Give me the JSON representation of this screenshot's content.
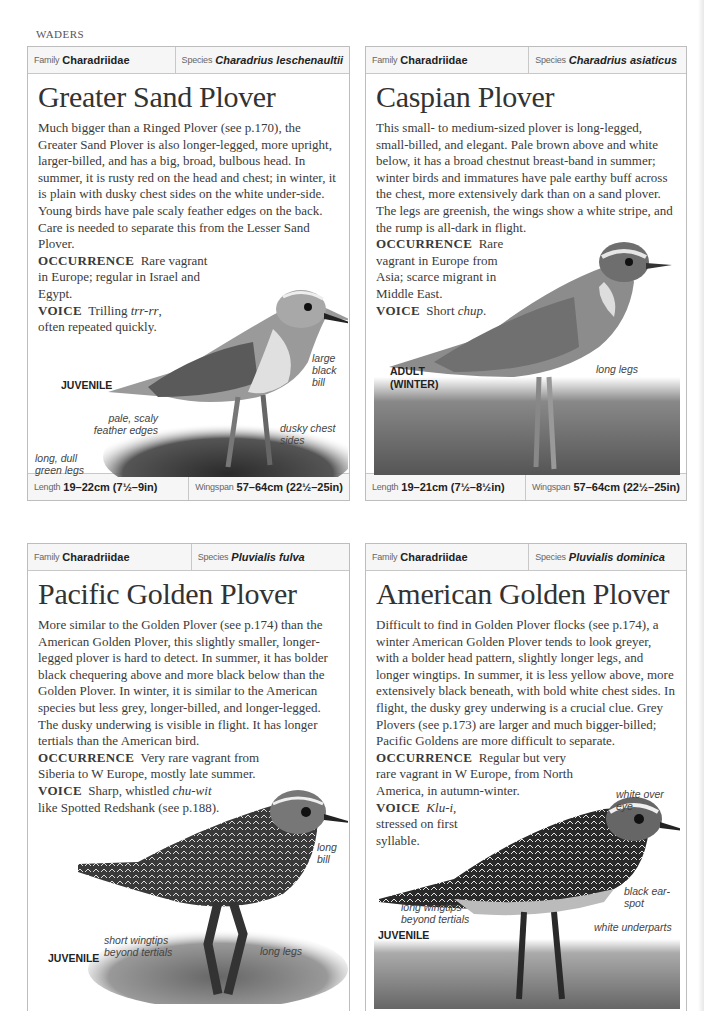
{
  "page": {
    "section": "WADERS"
  },
  "cards": [
    {
      "family_label": "Family",
      "family": "Charadriidae",
      "species_label": "Species",
      "species": "Charadrius leschenaultii",
      "title": "Greater Sand Plover",
      "description": "Much bigger than a Ringed Plover (see p.170), the Greater Sand Plover is also longer-legged, more upright, larger-billed, and has a big, broad, bulbous head. In summer, it is rusty red on the head and chest; in winter, it is plain with dusky chest sides on the white under-side. Young birds have pale scaly feather edges on the back. Care is needed to separate this from the Lesser Sand Plover.",
      "occurrence_label": "OCCURRENCE",
      "occurrence": "Rare vagrant in Europe; regular in Israel and Egypt.",
      "voice_label": "VOICE",
      "voice_pre": "Trilling ",
      "voice_call": "trr-rr",
      "voice_post": ", often repeated quickly.",
      "age_label": "JUVENILE",
      "annotations": [
        "large black bill",
        "pale, scaly feather edges",
        "dusky chest sides",
        "long, dull green legs"
      ],
      "length_label": "Length",
      "length": "19–22cm (7½–9in)",
      "wingspan_label": "Wingspan",
      "wingspan": "57–64cm (22½–25in)"
    },
    {
      "family_label": "Family",
      "family": "Charadriidae",
      "species_label": "Species",
      "species": "Charadrius asiaticus",
      "title": "Caspian Plover",
      "description": "This small- to medium-sized plover is long-legged, small-billed, and elegant. Pale brown above and white below, it has a broad chestnut breast-band in summer; winter birds and immatures have pale earthy buff across the chest, more extensively dark than on a sand plover. The legs are greenish, the wings show a white stripe, and the rump is all-dark in flight.",
      "occurrence_label": "OCCURRENCE",
      "occurrence": "Rare vagrant in Europe from Asia; scarce migrant in Middle East.",
      "voice_label": "VOICE",
      "voice_pre": "Short ",
      "voice_call": "chup",
      "voice_post": ".",
      "age_label": "ADULT (WINTER)",
      "annotations": [
        "long legs"
      ],
      "length_label": "Length",
      "length": "19–21cm (7½–8½in)",
      "wingspan_label": "Wingspan",
      "wingspan": "57–64cm (22½–25in)"
    },
    {
      "family_label": "Family",
      "family": "Charadriidae",
      "species_label": "Species",
      "species": "Pluvialis fulva",
      "title": "Pacific Golden Plover",
      "description": "More similar to the Golden Plover (see p.174) than the American Golden Plover, this slightly smaller, longer-legged plover is hard to detect. In summer, it has bolder black chequering above and more black below than the Golden Plover. In winter, it is similar to the American species but less grey, longer-billed, and longer-legged. The dusky underwing is visible in flight. It has longer tertials than the American bird.",
      "occurrence_label": "OCCURRENCE",
      "occurrence": "Very rare vagrant from Siberia to W Europe, mostly late summer.",
      "voice_label": "VOICE",
      "voice_pre": "Sharp, whistled ",
      "voice_call": "chu-wit",
      "voice_post": " like Spotted Redshank (see p.188).",
      "age_label": "JUVENILE",
      "annotations": [
        "long bill",
        "short wingtips beyond tertials",
        "long legs"
      ]
    },
    {
      "family_label": "Family",
      "family": "Charadriidae",
      "species_label": "Species",
      "species": "Pluvialis dominica",
      "title": "American Golden Plover",
      "description": "Difficult to find in Golden Plover flocks (see p.174), a winter American Golden Plover tends to look greyer, with a bolder head pattern, slightly longer legs, and longer wingtips. In summer, it is less yellow above, more extensively black beneath, with bold white chest sides. In flight, the dusky grey underwing is a crucial clue. Grey Plovers (see p.173) are larger and much bigger-billed; Pacific Goldens are more difficult to separate.",
      "occurrence_label": "OCCURRENCE",
      "occurrence": "Regular but very rare vagrant in W Europe, from North America, in autumn-winter.",
      "voice_label": "VOICE",
      "voice_pre": "",
      "voice_call": "Klu-i",
      "voice_post": ", stressed on first syllable.",
      "age_label": "JUVENILE",
      "annotations": [
        "white over eye",
        "black ear-spot",
        "long wingtips beyond tertials",
        "white underparts"
      ]
    }
  ]
}
